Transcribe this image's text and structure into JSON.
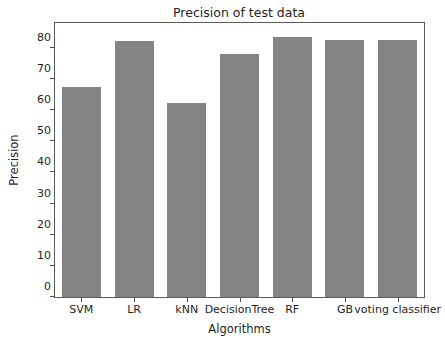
{
  "chart_data": {
    "type": "bar",
    "title": "Precision of test data",
    "xlabel": "Algorithms",
    "ylabel": "Precision",
    "categories": [
      "SVM",
      "LR",
      "kNN",
      "DecisionTree",
      "RF",
      "GB",
      "voting classifier"
    ],
    "values": [
      67.3,
      82.2,
      62.3,
      78.2,
      83.4,
      82.5,
      82.5
    ],
    "ylim": [
      0,
      88
    ],
    "yticks": [
      0,
      10,
      20,
      30,
      40,
      50,
      60,
      70,
      80
    ],
    "ytick_labels": [
      "0",
      "10",
      "20",
      "30",
      "40",
      "50",
      "60",
      "70",
      "80"
    ],
    "grid": false,
    "legend": false,
    "bar_color": "#848484",
    "axes_color": "#5a5a5a",
    "background_color": "#ffffff",
    "bar_width_fraction": 0.74
  }
}
